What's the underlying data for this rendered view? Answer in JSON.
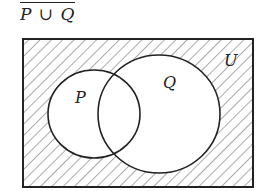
{
  "title": "P ∪ Q",
  "diagram": {
    "type": "venn",
    "universe_label": "U",
    "sets": [
      {
        "label": "P"
      },
      {
        "label": "Q"
      }
    ],
    "shaded_region": "complement of P ∪ Q",
    "colors": {
      "stroke": "#222222",
      "hatch": "#444444",
      "background": "#ffffff"
    }
  }
}
